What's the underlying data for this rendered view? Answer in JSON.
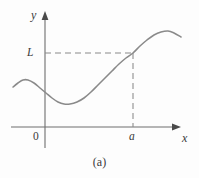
{
  "figure": {
    "caption": "(a)",
    "background_color": "#fdfdfd",
    "axis_color": "#6e6e6e",
    "curve_color": "#8a8a8a",
    "dashed_color": "#8a8a8a",
    "text_color": "#3a3a3a"
  },
  "labels": {
    "y_axis": "y",
    "x_axis": "x",
    "origin": "0",
    "limit_value": "L",
    "x_value": "a"
  },
  "chart_data": {
    "type": "line",
    "title": "",
    "subtitle": "",
    "xlabel": "x",
    "ylabel": "y",
    "legend": [],
    "grid": false,
    "annotations": [
      {
        "name": "limit-level",
        "label": "L",
        "kind": "horizontal-dashed-line",
        "y_px": 53,
        "from_x_px": 45,
        "to_x_px": 133
      },
      {
        "name": "x-value",
        "label": "a",
        "kind": "vertical-dashed-line",
        "x_px": 133,
        "from_y_px": 53,
        "to_y_px": 127
      },
      {
        "name": "origin",
        "label": "0",
        "kind": "axis-origin",
        "x_px": 45,
        "y_px": 127
      }
    ],
    "axes": {
      "x_axis_y_px": 127,
      "y_axis_x_px": 45,
      "x_axis_from_px": 11,
      "x_axis_to_px": 181,
      "y_axis_top_px": 12,
      "y_axis_bottom_px": 148
    },
    "series": [
      {
        "name": "f",
        "description": "Curve increasing toward the level L as x approaches a; f(a) = L",
        "points_px": [
          [
            13,
            87
          ],
          [
            18,
            83
          ],
          [
            23,
            80
          ],
          [
            28,
            80
          ],
          [
            34,
            83
          ],
          [
            40,
            88
          ],
          [
            46,
            93
          ],
          [
            52,
            98
          ],
          [
            58,
            102
          ],
          [
            64,
            104
          ],
          [
            70,
            104
          ],
          [
            77,
            102
          ],
          [
            84,
            98
          ],
          [
            91,
            92
          ],
          [
            98,
            85
          ],
          [
            105,
            78
          ],
          [
            112,
            71
          ],
          [
            119,
            64
          ],
          [
            126,
            58
          ],
          [
            133,
            53
          ],
          [
            140,
            46
          ],
          [
            147,
            40
          ],
          [
            154,
            35
          ],
          [
            161,
            32
          ],
          [
            168,
            31
          ],
          [
            174,
            33
          ],
          [
            181,
            37
          ]
        ]
      }
    ]
  }
}
